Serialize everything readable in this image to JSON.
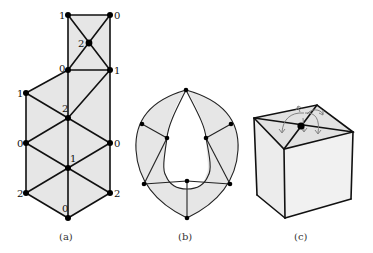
{
  "figure": {
    "panels": [
      {
        "id": "a",
        "caption": "(a)",
        "vertex_labels": {
          "top_left": "1",
          "top_right": "0",
          "top_center": "2",
          "mid_left": "0",
          "mid_right": "1",
          "left_upper": "1",
          "center_upper": "2",
          "left_middle": "0",
          "right_middle": "0",
          "center_lower": "1",
          "left_lower": "2",
          "right_lower": "2",
          "bottom": "0"
        }
      },
      {
        "id": "b",
        "caption": "(b)"
      },
      {
        "id": "c",
        "caption": "(c)"
      }
    ],
    "colors": {
      "face_fill": "#e6e6e6",
      "edge": "#111111",
      "arrow": "#777777",
      "background": "#ffffff"
    }
  }
}
